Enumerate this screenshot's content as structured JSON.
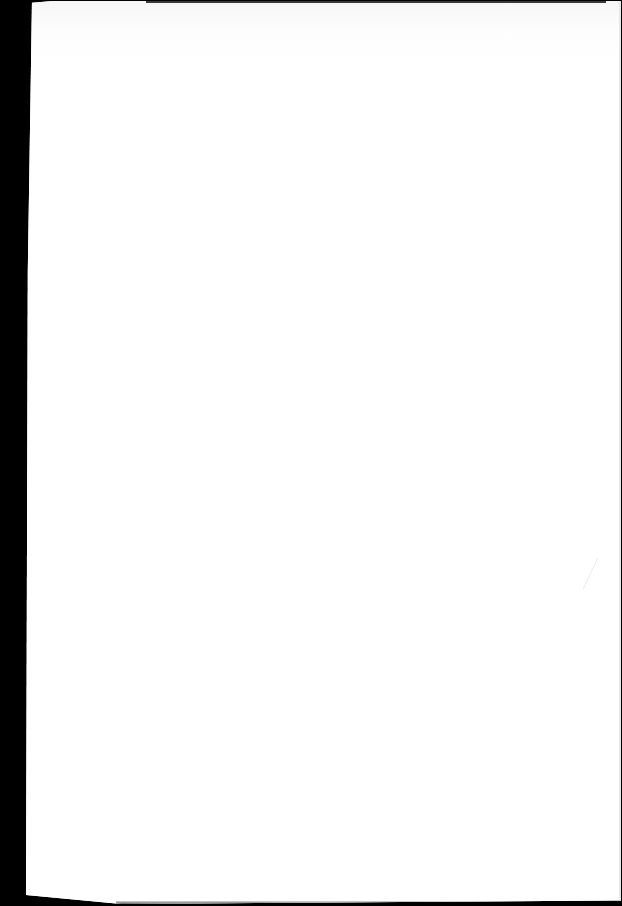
{
  "document": {
    "type": "scanned-page",
    "content": "",
    "colors": {
      "paper": "#fefefe",
      "background": "#000000"
    }
  }
}
